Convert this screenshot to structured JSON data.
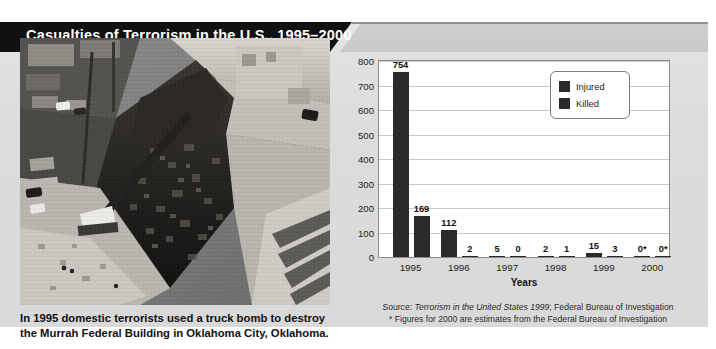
{
  "banner": {
    "title": "Casualties of Terrorism in the U.S., 1995–2000"
  },
  "photo": {
    "alt_name": "aerial-photo-murrah-federal-building-bombing"
  },
  "caption": {
    "line1": "In 1995 domestic terrorists used a truck bomb to destroy",
    "line2": "the Murrah Federal Building in Oklahoma City, Oklahoma."
  },
  "source_note": {
    "line1_prefix": "Source: ",
    "line1_italic": "Terrorism in the United States 1999",
    "line1_suffix": "; Federal Bureau of Investigation",
    "line2": "* Figures for 2000 are estimates from the Federal Bureau of Investigation"
  },
  "colors": {
    "bar": "#2b2b2b",
    "banner_bg": "#111111",
    "banner_text": "#ffffff",
    "panel_bg": "#dcdcdc",
    "plot_bg": "#ffffff",
    "grid": "#c9c9c9"
  },
  "chart_data": {
    "type": "bar",
    "title": "Casualties of Terrorism in the U.S., 1995–2000",
    "xlabel": "Years",
    "ylabel": "",
    "ylim": [
      0,
      800
    ],
    "ytick_step": 100,
    "yticks": [
      "0",
      "100",
      "200",
      "300",
      "400",
      "500",
      "600",
      "700",
      "800"
    ],
    "grid": true,
    "legend_position": "top-right",
    "categories": [
      "1995",
      "1996",
      "1997",
      "1998",
      "1999",
      "2000"
    ],
    "series": [
      {
        "name": "Injured",
        "values": [
          754,
          112,
          5,
          2,
          15,
          0
        ],
        "labels": [
          "754",
          "112",
          "5",
          "2",
          "15",
          "0*"
        ],
        "color": "#2b2b2b"
      },
      {
        "name": "Killed",
        "values": [
          169,
          2,
          0,
          1,
          3,
          0
        ],
        "labels": [
          "169",
          "2",
          "0",
          "1",
          "3",
          "0*"
        ],
        "color": "#2b2b2b"
      }
    ]
  }
}
